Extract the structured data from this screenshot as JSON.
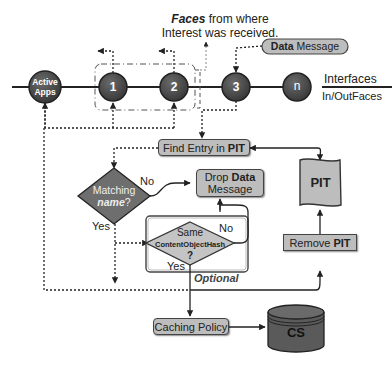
{
  "title": {
    "faces_bold": "Faces",
    "faces_rest": " from where",
    "line2": "Interest was received."
  },
  "data_message_pill": {
    "bold": "Data",
    "rest": " Message"
  },
  "interfaces": {
    "top": "Interfaces",
    "bottom": "In/OutFaces"
  },
  "nodes": [
    {
      "id": "active-apps",
      "line1": "Active",
      "line2": "Apps"
    },
    {
      "id": "face-1",
      "label": "1"
    },
    {
      "id": "face-2",
      "label": "2"
    },
    {
      "id": "face-3",
      "label": "3"
    },
    {
      "id": "face-n",
      "label": "n"
    }
  ],
  "find_entry": {
    "text": "Find Entry in ",
    "bold": "PIT"
  },
  "matching": {
    "line1": "Matching",
    "line2_bold": "name",
    "line2_rest": "?",
    "no": "No",
    "yes": "Yes"
  },
  "drop_data": {
    "line1": "Drop ",
    "line1_bold": "Data",
    "line2": "Message"
  },
  "same_hash": {
    "line1": "Same",
    "line2": "ContentObjectHash",
    "line3": "?",
    "no": "No",
    "yes": "Yes",
    "optional": "Optional"
  },
  "pit": {
    "label": "PIT"
  },
  "remove_pit": {
    "text": "Remove ",
    "bold": "PIT"
  },
  "caching_policy": {
    "label": "Caching Policy"
  },
  "cs": {
    "label": "CS"
  },
  "colors": {
    "node_fill": "#4a4a4a",
    "box_fill": "#bdbdbd",
    "diamond_dark": "#6e6e6e",
    "diamond_light": "#c4c4c4",
    "cs_fill": "#5a5a5a"
  }
}
